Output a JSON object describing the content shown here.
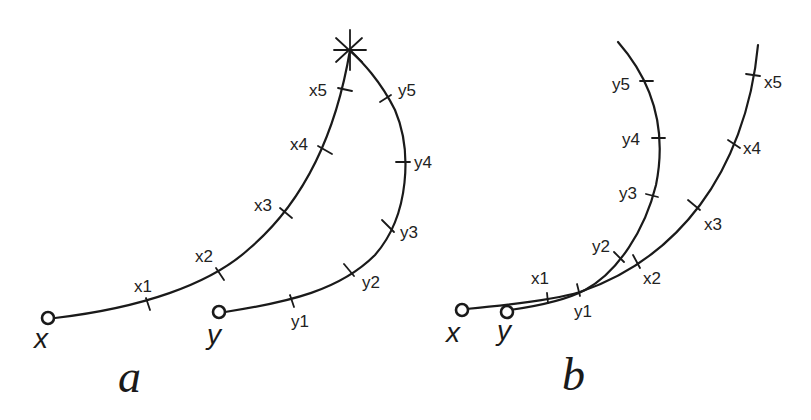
{
  "panels": [
    {
      "id": "a",
      "label": "a",
      "start_labels": {
        "x": "x",
        "y": "y"
      },
      "x_ticks": [
        "x1",
        "x2",
        "x3",
        "x4",
        "x5"
      ],
      "y_ticks": [
        "y1",
        "y2",
        "y3",
        "y4",
        "y5"
      ],
      "meeting_point": "star"
    },
    {
      "id": "b",
      "label": "b",
      "start_labels": {
        "x": "x",
        "y": "y"
      },
      "x_ticks": [
        "x1",
        "x2",
        "x3",
        "x4",
        "x5"
      ],
      "y_ticks": [
        "y1",
        "y2",
        "y3",
        "y4",
        "y5"
      ]
    }
  ],
  "colors": {
    "ink": "#1a1a1a",
    "background": "#ffffff"
  }
}
